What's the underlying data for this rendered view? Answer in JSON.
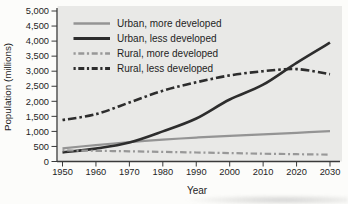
{
  "figure": {
    "background_color": "#fcfcfa",
    "plot_background_color": "#e9e9e7",
    "axis_color": "#3a3a3a",
    "text_color": "#1e1e1e"
  },
  "chart_data": {
    "type": "line",
    "title": "",
    "xlabel": "Year",
    "ylabel": "Population (millions)",
    "x": [
      1950,
      1960,
      1970,
      1980,
      1990,
      2000,
      2010,
      2020,
      2030
    ],
    "xtick_labels": [
      "1950",
      "1960",
      "1970",
      "1980",
      "1990",
      "2000",
      "2010",
      "2020",
      "2030"
    ],
    "xlim": [
      1950,
      2030
    ],
    "ylim": [
      0,
      5000
    ],
    "ytick_values": [
      0,
      500,
      1000,
      1500,
      2000,
      2500,
      3000,
      3500,
      4000,
      4500,
      5000
    ],
    "ytick_labels": [
      "0",
      "500",
      "1,000",
      "1,500",
      "2,000",
      "2,500",
      "3,000",
      "3,500",
      "4,000",
      "4,500",
      "5,000"
    ],
    "grid": false,
    "legend_position": "top-left-inside",
    "series": [
      {
        "name": "Urban, more developed",
        "color": "#949494",
        "style": "solid",
        "width": 2.2,
        "values": [
          440,
          545,
          645,
          725,
          795,
          855,
          905,
          955,
          1010
        ]
      },
      {
        "name": "Urban, less developed",
        "color": "#2d2d2d",
        "style": "solid",
        "width": 2.6,
        "values": [
          300,
          430,
          630,
          1000,
          1430,
          2060,
          2550,
          3280,
          3950
        ]
      },
      {
        "name": "Rural, more developed",
        "color": "#989898",
        "style": "dash-dot",
        "width": 2.2,
        "values": [
          370,
          355,
          340,
          320,
          300,
          280,
          260,
          243,
          228
        ]
      },
      {
        "name": "Rural, less developed",
        "color": "#2d2d2d",
        "style": "dash-dot",
        "width": 2.6,
        "values": [
          1380,
          1570,
          1960,
          2350,
          2630,
          2860,
          3000,
          3070,
          2900
        ]
      }
    ]
  }
}
